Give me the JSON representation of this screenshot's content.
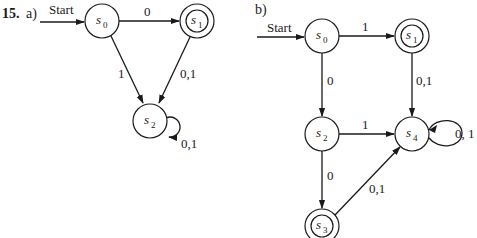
{
  "problem": {
    "number": "15.",
    "parts": [
      {
        "label": "a)",
        "start_label": "Start",
        "states": [
          {
            "id": "s0",
            "name": "s",
            "sub": "0",
            "accepting": false
          },
          {
            "id": "s1",
            "name": "s",
            "sub": "1",
            "accepting": true
          },
          {
            "id": "s2",
            "name": "s",
            "sub": "2",
            "accepting": false
          }
        ],
        "transitions": [
          {
            "from": "s0",
            "to": "s1",
            "label": "0"
          },
          {
            "from": "s0",
            "to": "s2",
            "label": "1"
          },
          {
            "from": "s1",
            "to": "s2",
            "label": "0,1"
          },
          {
            "from": "s2",
            "to": "s2",
            "label": "0,1"
          }
        ]
      },
      {
        "label": "b)",
        "start_label": "Start",
        "states": [
          {
            "id": "s0",
            "name": "s",
            "sub": "0",
            "accepting": false
          },
          {
            "id": "s1",
            "name": "s",
            "sub": "1",
            "accepting": true
          },
          {
            "id": "s2",
            "name": "s",
            "sub": "2",
            "accepting": false
          },
          {
            "id": "s3",
            "name": "s",
            "sub": "3",
            "accepting": true
          },
          {
            "id": "s4",
            "name": "s",
            "sub": "4",
            "accepting": false
          }
        ],
        "transitions": [
          {
            "from": "s0",
            "to": "s1",
            "label": "1"
          },
          {
            "from": "s0",
            "to": "s2",
            "label": "0"
          },
          {
            "from": "s1",
            "to": "s4",
            "label": "0,1"
          },
          {
            "from": "s2",
            "to": "s4",
            "label": "1"
          },
          {
            "from": "s2",
            "to": "s3",
            "label": "0"
          },
          {
            "from": "s3",
            "to": "s4",
            "label": "0,1"
          },
          {
            "from": "s4",
            "to": "s4",
            "label": "0, 1"
          }
        ]
      }
    ]
  }
}
